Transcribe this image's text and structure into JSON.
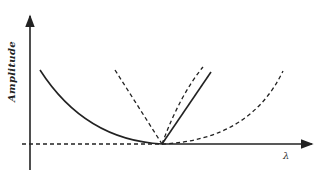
{
  "diagram": {
    "y_axis_label": "Amplitude",
    "x_axis_label": "λ",
    "colors": {
      "stroke": "#222222",
      "background": "#ffffff"
    },
    "curves": [
      {
        "name": "solid-decreasing-curve",
        "style": "solid",
        "description": "decreasing curve approaching minimum"
      },
      {
        "name": "solid-increasing-line",
        "style": "solid",
        "description": "line rising from minimum"
      },
      {
        "name": "dashed-steep-left-line",
        "style": "dashed"
      },
      {
        "name": "dashed-steep-right-curve",
        "style": "dashed"
      },
      {
        "name": "dashed-shallow-parabola",
        "style": "dashed"
      },
      {
        "name": "dashed-baseline",
        "style": "dashed"
      }
    ]
  }
}
